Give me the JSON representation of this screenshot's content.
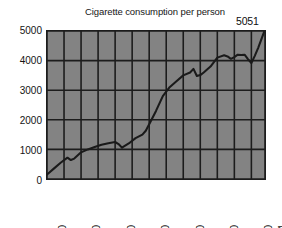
{
  "chart_data": {
    "type": "line",
    "title": "Cigarette consumption per person",
    "xlabel": "",
    "ylabel": "",
    "xlim": [
      1910,
      1974
    ],
    "ylim": [
      0,
      5000
    ],
    "grid": true,
    "legend": false,
    "y_ticks": [
      "5000",
      "4000",
      "3000",
      "2000",
      "1000",
      "0"
    ],
    "y_tick_values": [
      5000,
      4000,
      3000,
      2000,
      1000,
      0
    ],
    "x_ticks": [
      "1910",
      "1920",
      "1930",
      "1940",
      "1950",
      "1960",
      "1970",
      "1974"
    ],
    "x_tick_values": [
      1910,
      1920,
      1930,
      1940,
      1950,
      1960,
      1970,
      1974
    ],
    "x_gridlines": [
      1910,
      1915,
      1920,
      1925,
      1930,
      1935,
      1940,
      1945,
      1950,
      1955,
      1960,
      1965,
      1970,
      1974
    ],
    "y_gridlines": [
      0,
      1000,
      2000,
      3000,
      4000,
      5000
    ],
    "annotations": [
      {
        "text": "5051",
        "x": 1974,
        "y": 5051
      }
    ],
    "series": [
      {
        "name": "Cigarette consumption per person",
        "x": [
          1910,
          1912,
          1914,
          1916,
          1917,
          1918,
          1920,
          1922,
          1924,
          1926,
          1928,
          1930,
          1931,
          1932,
          1934,
          1936,
          1938,
          1939,
          1940,
          1942,
          1944,
          1946,
          1948,
          1950,
          1952,
          1953,
          1954,
          1955,
          1956,
          1958,
          1960,
          1962,
          1963,
          1964,
          1965,
          1966,
          1967,
          1968,
          1969,
          1970,
          1971,
          1972,
          1974
        ],
        "values": [
          150,
          350,
          550,
          720,
          640,
          690,
          900,
          1000,
          1080,
          1160,
          1210,
          1250,
          1180,
          1060,
          1200,
          1380,
          1500,
          1630,
          1850,
          2300,
          2800,
          3100,
          3300,
          3500,
          3600,
          3720,
          3480,
          3510,
          3600,
          3800,
          4100,
          4180,
          4140,
          4060,
          4120,
          4200,
          4190,
          4200,
          4050,
          3920,
          4160,
          4430,
          5051
        ]
      }
    ],
    "colors": {
      "line": "#1a1a1a",
      "plot_background": "#838383",
      "grid": "#1c1c1c",
      "axis_text": "#141414",
      "page_background": "#ffffff"
    }
  }
}
